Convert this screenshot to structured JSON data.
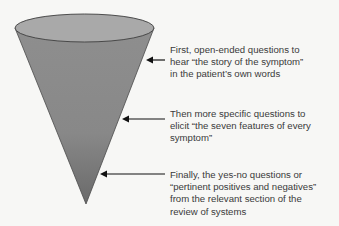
{
  "diagram": {
    "type": "funnel-cone",
    "colors": {
      "cone_top": "#8f8f8f",
      "cone_bottom": "#6f6f6f",
      "ellipse_fill": "#a8a8a8",
      "outline": "#4a4a4a",
      "arrow": "#111111",
      "text": "#3a3a3a",
      "background": "#f7f7f5"
    },
    "stages": [
      {
        "order": 1,
        "lines": [
          "First, open-ended questions to",
          "hear “the story of the symptom”",
          "in the patient’s own words"
        ]
      },
      {
        "order": 2,
        "lines": [
          "Then more specific questions to",
          "elicit “the seven features of every",
          "symptom”"
        ]
      },
      {
        "order": 3,
        "lines": [
          "Finally, the yes-no questions or",
          "“pertinent positives and negatives”",
          "from the relevant section of the",
          "review of systems"
        ]
      }
    ]
  }
}
